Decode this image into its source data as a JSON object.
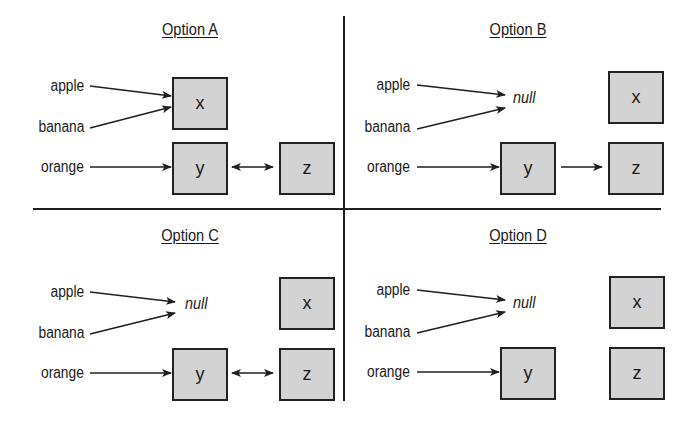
{
  "diagram": {
    "colors": {
      "line": "#1f1f1f",
      "box_fill": "#d3d3d3",
      "box_border": "#222222",
      "background": "#ffffff"
    },
    "panels": [
      {
        "id": "A",
        "title": "Option A",
        "labels": [
          "apple",
          "banana",
          "orange"
        ],
        "null_label": "",
        "boxes": {
          "x": "x",
          "y": "y",
          "z": "z"
        },
        "relations": "apple→x, banana→x, orange→y, y↔z"
      },
      {
        "id": "B",
        "title": "Option B",
        "labels": [
          "apple",
          "banana",
          "orange"
        ],
        "null_label": "null",
        "boxes": {
          "x": "x",
          "y": "y",
          "z": "z"
        },
        "relations": "apple→null, banana→null, orange→y, y→z"
      },
      {
        "id": "C",
        "title": "Option C",
        "labels": [
          "apple",
          "banana",
          "orange"
        ],
        "null_label": "null",
        "boxes": {
          "x": "x",
          "y": "y",
          "z": "z"
        },
        "relations": "apple→null, banana→null, orange→y, y↔z"
      },
      {
        "id": "D",
        "title": "Option D",
        "labels": [
          "apple",
          "banana",
          "orange"
        ],
        "null_label": "null",
        "boxes": {
          "x": "x",
          "y": "y",
          "z": "z"
        },
        "relations": "apple→null, banana→null, orange→y"
      }
    ]
  }
}
